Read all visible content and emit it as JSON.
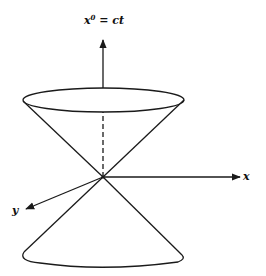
{
  "diagram": {
    "type": "light-cone",
    "labels": {
      "time_axis": "x",
      "time_axis_sup": "0",
      "time_axis_rest": " = ct",
      "x_axis": "x",
      "y_axis": "y"
    },
    "colors": {
      "stroke": "#1a1a1a",
      "background": "#ffffff"
    }
  }
}
